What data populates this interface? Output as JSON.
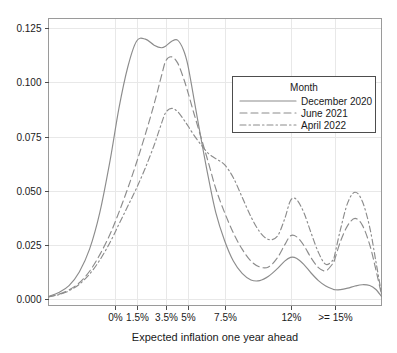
{
  "chart_data": {
    "type": "line",
    "title": "",
    "xlabel": "Expected inflation one year ahead",
    "ylabel": "",
    "grid": true,
    "legend_position": "top-right",
    "legend_title": "Month",
    "xtick_labels": [
      "0%",
      "1.5%",
      "3.5%",
      "5%",
      "7.5%",
      "12%",
      ">= 15%"
    ],
    "xtick_values": [
      0,
      1.5,
      3.5,
      5,
      7.5,
      12,
      15
    ],
    "ytick_labels": [
      "0.000",
      "0.025",
      "0.050",
      "0.075",
      "0.100",
      "0.125"
    ],
    "ytick_values": [
      0,
      0.025,
      0.05,
      0.075,
      0.1,
      0.125
    ],
    "xlim": [
      -4.5,
      18.2
    ],
    "ylim": [
      -0.003,
      0.1295
    ],
    "x": [
      -4.5,
      -3.8,
      -3.1,
      -2.4,
      -1.7,
      -1.0,
      -0.3,
      0.3,
      0.9,
      1.5,
      2.1,
      2.7,
      3.2,
      3.5,
      3.9,
      4.3,
      4.7,
      5.0,
      5.4,
      5.9,
      6.4,
      6.9,
      7.5,
      8.1,
      8.7,
      9.3,
      9.9,
      10.5,
      11.1,
      11.6,
      12.0,
      12.4,
      12.9,
      13.4,
      13.9,
      14.4,
      14.9,
      15.0,
      15.4,
      15.9,
      16.4,
      16.9,
      17.4,
      17.8,
      18.2
    ],
    "series": [
      {
        "name": "December 2020",
        "style": "solid",
        "color": "#8c8c8c",
        "values": [
          0.0012,
          0.003,
          0.0062,
          0.0125,
          0.023,
          0.04,
          0.064,
          0.088,
          0.107,
          0.119,
          0.12,
          0.1172,
          0.116,
          0.1168,
          0.119,
          0.1195,
          0.115,
          0.108,
          0.093,
          0.074,
          0.056,
          0.04,
          0.027,
          0.0175,
          0.0118,
          0.0088,
          0.0085,
          0.0105,
          0.014,
          0.0175,
          0.0192,
          0.0188,
          0.016,
          0.012,
          0.0085,
          0.006,
          0.0045,
          0.0043,
          0.0043,
          0.005,
          0.006,
          0.0066,
          0.0062,
          0.0045,
          0.0012
        ]
      },
      {
        "name": "June 2021",
        "style": "dashed",
        "color": "#8c8c8c",
        "values": [
          0.001,
          0.0022,
          0.0042,
          0.0075,
          0.0128,
          0.0205,
          0.03,
          0.04,
          0.051,
          0.063,
          0.076,
          0.09,
          0.103,
          0.11,
          0.1118,
          0.109,
          0.102,
          0.0955,
          0.086,
          0.0745,
          0.063,
          0.051,
          0.04,
          0.0305,
          0.023,
          0.0175,
          0.0148,
          0.0148,
          0.019,
          0.025,
          0.0292,
          0.0288,
          0.0248,
          0.019,
          0.0145,
          0.013,
          0.0165,
          0.018,
          0.0265,
          0.034,
          0.0372,
          0.034,
          0.025,
          0.014,
          0.002
        ]
      },
      {
        "name": "April 2022",
        "style": "dashdot",
        "color": "#8c8c8c",
        "values": [
          0.001,
          0.002,
          0.0038,
          0.0068,
          0.0115,
          0.018,
          0.0262,
          0.0345,
          0.0428,
          0.0512,
          0.0605,
          0.071,
          0.081,
          0.0862,
          0.088,
          0.0865,
          0.083,
          0.08,
          0.0758,
          0.0712,
          0.0672,
          0.0648,
          0.062,
          0.056,
          0.047,
          0.038,
          0.031,
          0.0275,
          0.029,
          0.037,
          0.0455,
          0.046,
          0.04,
          0.0305,
          0.0215,
          0.016,
          0.018,
          0.02,
          0.032,
          0.0445,
          0.0493,
          0.045,
          0.033,
          0.018,
          0.0025
        ]
      }
    ]
  },
  "axes": {
    "xlabel": "Expected inflation one year ahead",
    "ytick_labels": [
      "0.000",
      "0.025",
      "0.050",
      "0.075",
      "0.100",
      "0.125"
    ],
    "xtick_labels": [
      "0%",
      "1.5%",
      "3.5%",
      "5%",
      "7.5%",
      "12%",
      ">= 15%"
    ]
  },
  "legend": {
    "title": "Month",
    "items": [
      {
        "label": "December 2020",
        "style": "solid"
      },
      {
        "label": "June 2021",
        "style": "dashed"
      },
      {
        "label": "April 2022",
        "style": "dashdot"
      }
    ]
  }
}
